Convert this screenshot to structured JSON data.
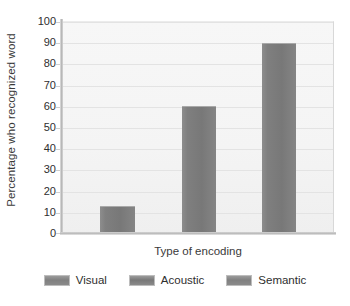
{
  "chart_data": {
    "type": "bar",
    "title": "",
    "xlabel": "Type of encoding",
    "ylabel": "Percentage who recognized word",
    "categories": [
      "Visual",
      "Acoustic",
      "Semantic"
    ],
    "values": [
      13,
      60,
      90
    ],
    "series": [
      {
        "name": "Percentage who recognized word",
        "values": [
          13,
          60,
          90
        ]
      }
    ],
    "ylim": [
      0,
      100
    ],
    "ytick_labels": [
      "100",
      "90",
      "80",
      "70",
      "60",
      "50",
      "40",
      "30",
      "20",
      "10",
      "0"
    ],
    "ytick_values": [
      100,
      90,
      80,
      70,
      60,
      50,
      40,
      30,
      20,
      10,
      0
    ],
    "ytick_step": 10,
    "grid": "horizontal",
    "legend_position": "bottom",
    "legend": [
      {
        "label": "Visual",
        "swatch_color": "#808080"
      },
      {
        "label": "Acoustic",
        "swatch_color": "#787878"
      },
      {
        "label": "Semantic",
        "swatch_color": "#808080"
      }
    ],
    "colors": {
      "bar_fill": "#7f7f7f",
      "plot_background": "#f4f4f4",
      "gridline": "#e3e3e3",
      "axis_line": "#bdbdbd",
      "text": "#2e2e2e",
      "page_background": "#ffffff"
    }
  }
}
